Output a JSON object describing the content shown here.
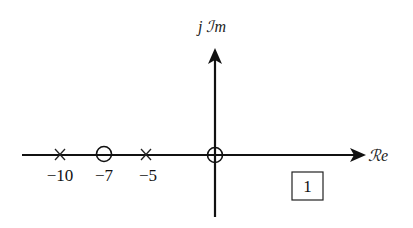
{
  "diagram": {
    "type": "pole-zero plot",
    "axes": {
      "real_label": "ℛe",
      "imag_label": "j ℐm"
    },
    "poles": [
      {
        "value": -10,
        "label": "−10",
        "marker": "x"
      },
      {
        "value": -5,
        "label": "−5",
        "marker": "x"
      }
    ],
    "zeros": [
      {
        "value": -7,
        "label": "−7",
        "marker": "o"
      },
      {
        "value": 0,
        "label": "",
        "marker": "o"
      }
    ],
    "gain_box": "1",
    "colors": {
      "stroke": "#111111",
      "background": "#ffffff"
    }
  }
}
